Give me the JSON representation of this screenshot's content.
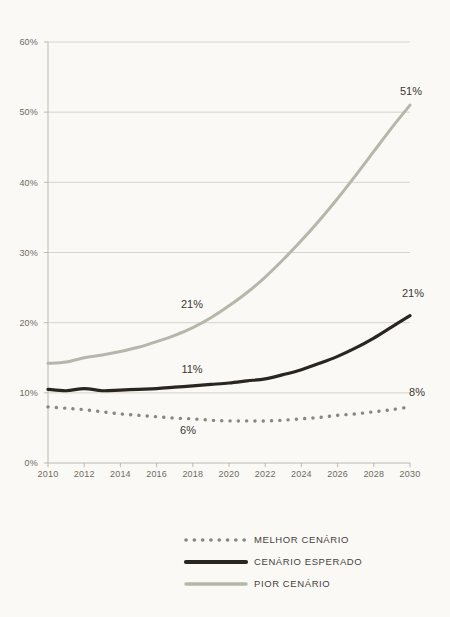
{
  "chart_data": {
    "type": "line",
    "title": "",
    "subtitle": "",
    "xlabel": "",
    "ylabel": "",
    "xlim": [
      2010,
      2030
    ],
    "ylim": [
      0,
      60
    ],
    "grid": true,
    "legend_position": "bottom-center",
    "y_ticks": [
      "0%",
      "10%",
      "20%",
      "30%",
      "40%",
      "50%",
      "60%"
    ],
    "y_tick_values": [
      0,
      10,
      20,
      30,
      40,
      50,
      60
    ],
    "x_ticks": [
      "2010",
      "2012",
      "2014",
      "2016",
      "2018",
      "2020",
      "2022",
      "2024",
      "2026",
      "2028",
      "2030"
    ],
    "x_tick_values": [
      2010,
      2012,
      2014,
      2016,
      2018,
      2020,
      2022,
      2024,
      2026,
      2028,
      2030
    ],
    "x": [
      2010,
      2011,
      2012,
      2013,
      2014,
      2015,
      2016,
      2017,
      2018,
      2019,
      2020,
      2021,
      2022,
      2023,
      2024,
      2025,
      2026,
      2027,
      2028,
      2029,
      2030
    ],
    "series": [
      {
        "name": "MELHOR CENÁRIO",
        "style": "dotted",
        "color": "#8a8781",
        "values": [
          8.0,
          7.8,
          7.6,
          7.3,
          7.0,
          6.8,
          6.6,
          6.4,
          6.3,
          6.1,
          6.0,
          6.0,
          6.0,
          6.1,
          6.3,
          6.5,
          6.8,
          7.0,
          7.3,
          7.6,
          8.0
        ]
      },
      {
        "name": "CENÁRIO ESPERADO",
        "style": "solid-thick",
        "color": "#2b2520",
        "values": [
          10.5,
          10.3,
          10.6,
          10.3,
          10.4,
          10.5,
          10.6,
          10.8,
          11.0,
          11.2,
          11.4,
          11.7,
          12.0,
          12.6,
          13.3,
          14.2,
          15.2,
          16.4,
          17.8,
          19.4,
          21.0
        ]
      },
      {
        "name": "PIOR CENÁRIO",
        "style": "solid",
        "color": "#b6b6aa",
        "values": [
          14.2,
          14.4,
          15.0,
          15.4,
          15.9,
          16.5,
          17.3,
          18.2,
          19.3,
          20.7,
          22.4,
          24.3,
          26.5,
          29.0,
          31.7,
          34.6,
          37.7,
          41.0,
          44.4,
          47.8,
          51.0
        ]
      }
    ],
    "annotations": [
      {
        "text": "51%",
        "x": 2030,
        "y": 51,
        "series": "PIOR CENÁRIO",
        "px": 411,
        "py": 95
      },
      {
        "text": "21%",
        "x": 2018,
        "y": 21,
        "series": "PIOR CENÁRIO",
        "px": 192,
        "py": 308
      },
      {
        "text": "21%",
        "x": 2030,
        "y": 21,
        "series": "CENÁRIO ESPERADO",
        "px": 413,
        "py": 297
      },
      {
        "text": "11%",
        "x": 2018,
        "y": 11,
        "series": "CENÁRIO ESPERADO",
        "px": 192,
        "py": 373
      },
      {
        "text": "6%",
        "x": 2018,
        "y": 6,
        "series": "MELHOR CENÁRIO",
        "px": 188,
        "py": 434
      },
      {
        "text": "8%",
        "x": 2030,
        "y": 8,
        "series": "MELHOR CENÁRIO",
        "px": 417,
        "py": 396
      }
    ]
  },
  "legend": {
    "items": [
      {
        "label": "MELHOR CENÁRIO",
        "style": "dotted",
        "color": "#8a8781"
      },
      {
        "label": "CENÁRIO ESPERADO",
        "style": "solid-thick",
        "color": "#2b2520"
      },
      {
        "label": "PIOR CENÁRIO",
        "style": "solid",
        "color": "#b6b6aa"
      }
    ]
  },
  "colors": {
    "background": "#faf9f5",
    "gridline": "#cfccc2",
    "axis": "#b5b2a8",
    "tick_text": "#6e6a62",
    "label_text": "#3b3731"
  }
}
